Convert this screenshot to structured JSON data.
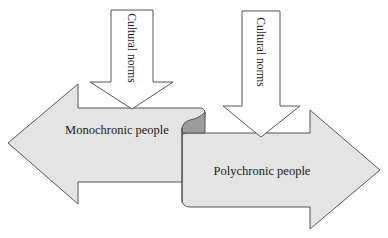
{
  "diagram": {
    "type": "arrows",
    "colors": {
      "fill": "#e4e4e4",
      "curl": "#9c9c9c",
      "stroke": "#555555",
      "down_arrow_fill": "#ffffff",
      "text": "#1a1a1a"
    },
    "left_arrow": {
      "label": "Monochronic people",
      "direction": "left"
    },
    "right_arrow": {
      "label": "Polychronic people",
      "direction": "right"
    },
    "down_arrows": [
      {
        "label": "Cultural norms",
        "target": "Monochronic people"
      },
      {
        "label": "Cultural norms",
        "target": "Polychronic people"
      }
    ]
  }
}
